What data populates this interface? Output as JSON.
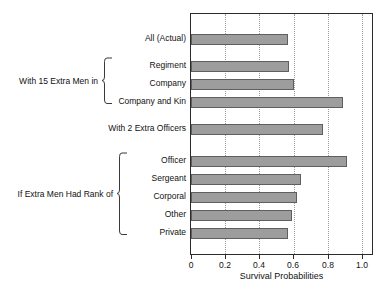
{
  "chart_data": {
    "type": "bar",
    "orientation": "horizontal",
    "title": "",
    "xlabel": "Survival Probabilities",
    "ylabel": "",
    "xlim": [
      0,
      1.07
    ],
    "xticks": [
      0,
      0.2,
      0.4,
      0.6,
      0.8,
      1.0
    ],
    "xtick_labels": [
      "0",
      "0.2",
      "0.4",
      "0.6",
      "0.8",
      "1.0"
    ],
    "grid": "vertical-dotted",
    "legend": "none",
    "bar_color": "#9d9d9d",
    "bar_edge_color": "#5f5f5f",
    "categories": [
      "All (Actual)",
      "Regiment",
      "Company",
      "Company and Kin",
      "With 2 Extra Officers",
      "Officer",
      "Sergeant",
      "Corporal",
      "Other",
      "Private"
    ],
    "values": [
      0.575,
      0.58,
      0.61,
      0.9,
      0.78,
      0.92,
      0.65,
      0.625,
      0.6,
      0.575
    ],
    "groups": [
      {
        "label": "With 15 Extra Men in",
        "members": [
          "Regiment",
          "Company",
          "Company and Kin"
        ]
      },
      {
        "label": "If Extra Men Had Rank of",
        "members": [
          "Officer",
          "Sergeant",
          "Corporal",
          "Other",
          "Private"
        ]
      }
    ]
  }
}
